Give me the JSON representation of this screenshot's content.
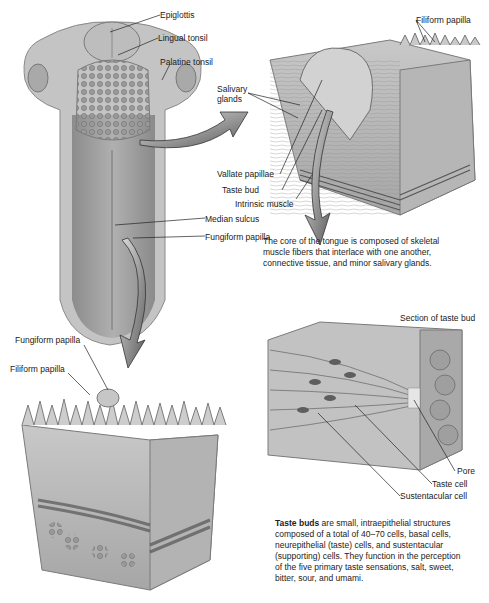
{
  "figure": {
    "tongue_overview": {
      "labels": {
        "epiglottis": "Epiglottis",
        "lingual_tonsil": "Lingual tonsil",
        "palatine_tonsil": "Palatine tonsil",
        "median_sulcus": "Median sulcus",
        "fungiform_papilla": "Fungiform papilla"
      }
    },
    "vallate_section": {
      "labels": {
        "filiform_papilla": "Filiform papilla",
        "salivary_glands_line1": "Salivary",
        "salivary_glands_line2": "glands",
        "vallate_papillae": "Vallate papillae",
        "taste_bud": "Taste bud",
        "intrinsic_muscle": "Intrinsic muscle"
      },
      "caption_lines": [
        "The core of the tongue is composed of skeletal",
        "muscle fibers that interlace with one another,",
        "connective tissue, and minor salivary glands."
      ]
    },
    "fungiform_section": {
      "labels": {
        "fungiform_papilla": "Fungiform papilla",
        "filiform_papilla": "Filiform papilla"
      }
    },
    "taste_bud_section": {
      "title": "Section of taste bud",
      "labels": {
        "pore": "Pore",
        "taste_cell": "Taste cell",
        "sustentacular_cell": "Sustentacular cell"
      },
      "caption_bold": "Taste buds",
      "caption_lines": [
        " are small, intraepithelial structures",
        "composed of a total of 40–70 cells, basal cells,",
        "neurepithelial (taste) cells, and sustentacular",
        "(supporting) cells. They function in the perception",
        "of the five primary taste sensations, salt, sweet,",
        "bitter, sour, and umami."
      ]
    }
  }
}
